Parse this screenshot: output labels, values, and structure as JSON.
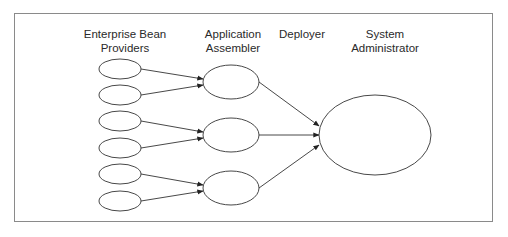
{
  "diagram": {
    "type": "flow",
    "columns": [
      {
        "id": "providers",
        "label": "Enterprise Bean\nProviders"
      },
      {
        "id": "assembler",
        "label": "Application\nAssembler"
      },
      {
        "id": "deployer",
        "label": "Deployer"
      },
      {
        "id": "admin",
        "label": "System\nAdministrator"
      }
    ],
    "nodes": {
      "providers": [
        {
          "id": "p1",
          "cx": 120,
          "cy": 69,
          "rx": 21,
          "ry": 10
        },
        {
          "id": "p2",
          "cx": 120,
          "cy": 95,
          "rx": 21,
          "ry": 10
        },
        {
          "id": "p3",
          "cx": 120,
          "cy": 121,
          "rx": 21,
          "ry": 10
        },
        {
          "id": "p4",
          "cx": 120,
          "cy": 148,
          "rx": 21,
          "ry": 10
        },
        {
          "id": "p5",
          "cx": 120,
          "cy": 174,
          "rx": 21,
          "ry": 10
        },
        {
          "id": "p6",
          "cx": 120,
          "cy": 201,
          "rx": 21,
          "ry": 10
        }
      ],
      "assemblers": [
        {
          "id": "a1",
          "cx": 231,
          "cy": 82,
          "rx": 28,
          "ry": 17
        },
        {
          "id": "a2",
          "cx": 231,
          "cy": 135,
          "rx": 28,
          "ry": 17
        },
        {
          "id": "a3",
          "cx": 231,
          "cy": 188,
          "rx": 28,
          "ry": 17
        }
      ],
      "admin": {
        "id": "s1",
        "cx": 375,
        "cy": 135,
        "rx": 56,
        "ry": 40
      }
    },
    "edges": [
      {
        "from": "p1",
        "to": "a1",
        "x1": 141,
        "y1": 69,
        "x2": 203,
        "y2": 79
      },
      {
        "from": "p2",
        "to": "a1",
        "x1": 141,
        "y1": 95,
        "x2": 203,
        "y2": 85
      },
      {
        "from": "p3",
        "to": "a2",
        "x1": 141,
        "y1": 121,
        "x2": 203,
        "y2": 132
      },
      {
        "from": "p4",
        "to": "a2",
        "x1": 141,
        "y1": 148,
        "x2": 203,
        "y2": 138
      },
      {
        "from": "p5",
        "to": "a3",
        "x1": 141,
        "y1": 174,
        "x2": 203,
        "y2": 185
      },
      {
        "from": "p6",
        "to": "a3",
        "x1": 141,
        "y1": 201,
        "x2": 203,
        "y2": 191
      },
      {
        "from": "a1",
        "to": "s1",
        "x1": 259,
        "y1": 82,
        "x2": 319,
        "y2": 126
      },
      {
        "from": "a2",
        "to": "s1",
        "x1": 259,
        "y1": 135,
        "x2": 319,
        "y2": 135
      },
      {
        "from": "a3",
        "to": "s1",
        "x1": 259,
        "y1": 188,
        "x2": 319,
        "y2": 145
      }
    ],
    "colors": {
      "stroke": "#333333",
      "frame": "#8a8a8a",
      "text": "#2a2a2a"
    }
  }
}
